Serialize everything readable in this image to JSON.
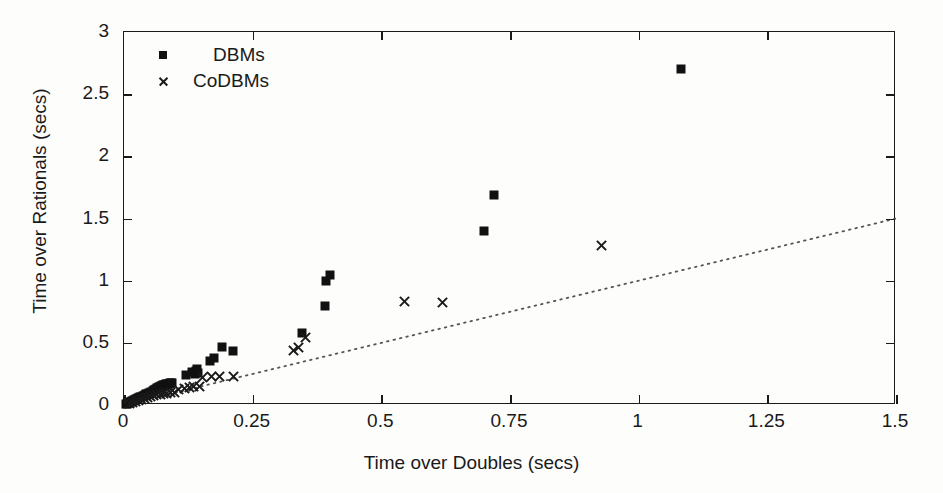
{
  "chart_data": {
    "type": "scatter",
    "title": "",
    "xlabel": "Time over Doubles (secs)",
    "ylabel": "Time over Rationals (secs)",
    "xlim": [
      0,
      1.5
    ],
    "ylim": [
      0,
      3
    ],
    "xticks": [
      0,
      0.25,
      0.5,
      0.75,
      1,
      1.25,
      1.5
    ],
    "xticklabels": [
      "0",
      "0.25",
      "0.5",
      "0.75",
      "1",
      "1.25",
      "1.5"
    ],
    "yticks": [
      0,
      0.5,
      1,
      1.5,
      2,
      2.5,
      3
    ],
    "yticklabels": [
      "0",
      "0.5",
      "1",
      "1.5",
      "2",
      "2.5",
      "3"
    ],
    "grid": false,
    "legend_position": "top-left",
    "reference_line": {
      "name": "identity-line",
      "style": "dotted",
      "x": [
        0,
        1.5
      ],
      "y": [
        0,
        1.5
      ]
    },
    "series": [
      {
        "name": "DBMs",
        "marker": "square",
        "color": "#111111",
        "points": [
          [
            0.004,
            0.008
          ],
          [
            0.006,
            0.012
          ],
          [
            0.008,
            0.015
          ],
          [
            0.01,
            0.018
          ],
          [
            0.012,
            0.022
          ],
          [
            0.014,
            0.026
          ],
          [
            0.016,
            0.03
          ],
          [
            0.018,
            0.034
          ],
          [
            0.02,
            0.038
          ],
          [
            0.022,
            0.042
          ],
          [
            0.024,
            0.046
          ],
          [
            0.026,
            0.05
          ],
          [
            0.028,
            0.054
          ],
          [
            0.03,
            0.058
          ],
          [
            0.032,
            0.062
          ],
          [
            0.034,
            0.066
          ],
          [
            0.036,
            0.07
          ],
          [
            0.038,
            0.074
          ],
          [
            0.04,
            0.08
          ],
          [
            0.042,
            0.085
          ],
          [
            0.045,
            0.09
          ],
          [
            0.048,
            0.096
          ],
          [
            0.05,
            0.1
          ],
          [
            0.053,
            0.106
          ],
          [
            0.056,
            0.112
          ],
          [
            0.058,
            0.118
          ],
          [
            0.06,
            0.124
          ],
          [
            0.062,
            0.13
          ],
          [
            0.064,
            0.136
          ],
          [
            0.066,
            0.14
          ],
          [
            0.068,
            0.144
          ],
          [
            0.07,
            0.148
          ],
          [
            0.072,
            0.152
          ],
          [
            0.074,
            0.155
          ],
          [
            0.076,
            0.158
          ],
          [
            0.078,
            0.16
          ],
          [
            0.08,
            0.163
          ],
          [
            0.082,
            0.166
          ],
          [
            0.084,
            0.168
          ],
          [
            0.086,
            0.17
          ],
          [
            0.088,
            0.172
          ],
          [
            0.09,
            0.175
          ],
          [
            0.092,
            0.178
          ],
          [
            0.094,
            0.18
          ],
          [
            0.12,
            0.24
          ],
          [
            0.132,
            0.262
          ],
          [
            0.138,
            0.25
          ],
          [
            0.14,
            0.272
          ],
          [
            0.142,
            0.29
          ],
          [
            0.144,
            0.255
          ],
          [
            0.168,
            0.35
          ],
          [
            0.175,
            0.378
          ],
          [
            0.19,
            0.47
          ],
          [
            0.212,
            0.432
          ],
          [
            0.345,
            0.58
          ],
          [
            0.39,
            0.8
          ],
          [
            0.393,
            1.0
          ],
          [
            0.4,
            1.045
          ],
          [
            0.7,
            1.4
          ],
          [
            0.718,
            1.69
          ],
          [
            1.082,
            2.7
          ]
        ]
      },
      {
        "name": "CoDBMs",
        "marker": "x",
        "color": "#1a1a1a",
        "points": [
          [
            0.01,
            0.012
          ],
          [
            0.016,
            0.018
          ],
          [
            0.022,
            0.026
          ],
          [
            0.028,
            0.034
          ],
          [
            0.034,
            0.042
          ],
          [
            0.04,
            0.05
          ],
          [
            0.046,
            0.058
          ],
          [
            0.052,
            0.066
          ],
          [
            0.058,
            0.074
          ],
          [
            0.064,
            0.082
          ],
          [
            0.07,
            0.086
          ],
          [
            0.076,
            0.09
          ],
          [
            0.082,
            0.094
          ],
          [
            0.09,
            0.098
          ],
          [
            0.098,
            0.102
          ],
          [
            0.106,
            0.122
          ],
          [
            0.118,
            0.135
          ],
          [
            0.128,
            0.142
          ],
          [
            0.136,
            0.148
          ],
          [
            0.146,
            0.152
          ],
          [
            0.152,
            0.225
          ],
          [
            0.17,
            0.232
          ],
          [
            0.186,
            0.228
          ],
          [
            0.212,
            0.23
          ],
          [
            0.33,
            0.44
          ],
          [
            0.34,
            0.462
          ],
          [
            0.352,
            0.545
          ],
          [
            0.545,
            0.83
          ],
          [
            0.618,
            0.825
          ],
          [
            0.928,
            1.28
          ]
        ]
      }
    ]
  },
  "legend": {
    "items": [
      {
        "label": "DBMs",
        "marker": "square"
      },
      {
        "label": "CoDBMs",
        "marker": "x"
      }
    ]
  }
}
